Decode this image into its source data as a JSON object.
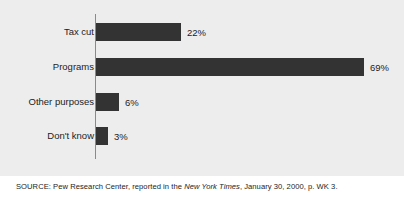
{
  "chart_data": {
    "type": "bar",
    "orientation": "horizontal",
    "title": "",
    "subtitle": "",
    "xlabel": "",
    "ylabel": "",
    "categories": [
      "Tax cut",
      "Programs",
      "Other purposes",
      "Don't know"
    ],
    "values": [
      22,
      69,
      6,
      3
    ],
    "value_labels": [
      "22%",
      "69%",
      "6%",
      "3%"
    ],
    "xlim": [
      0,
      69
    ],
    "grid": false,
    "legend": null,
    "bar_color": "#333333",
    "panel_color": "#ededed",
    "axis_color": "#8a8a8a"
  },
  "figure": {
    "clipped_title": "",
    "source": {
      "prefix": "SOURCE: Pew Research Center, reported in the ",
      "publication": "New York Times",
      "suffix": ", January 30, 2000, p. WK 3."
    }
  }
}
